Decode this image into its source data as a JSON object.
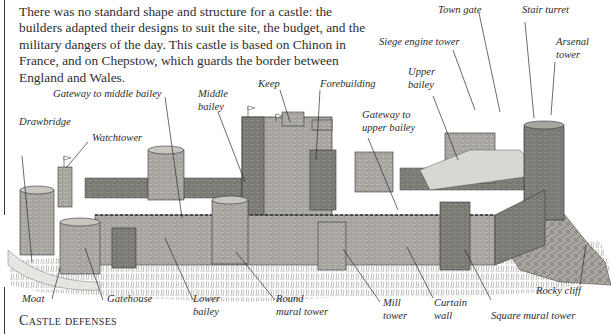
{
  "intro_text": "There was no standard shape and structure for a castle: the builders adapted their designs to suit the site, the budget, and the military dangers of the day. This castle is based on Chinon in France, and on Chepstow, which guards the border between England and Wales.",
  "caption": "Castle defenses",
  "labels": {
    "town_gate": "Town gate",
    "stair_turret": "Stair turret",
    "siege_engine_tower": "Siege engine tower",
    "arsenal_tower_1": "Arsenal",
    "arsenal_tower_2": "tower",
    "upper_bailey_1": "Upper",
    "upper_bailey_2": "bailey",
    "keep": "Keep",
    "forebuilding": "Forebuilding",
    "gateway_middle_bailey": "Gateway to middle bailey",
    "middle_bailey_1": "Middle",
    "middle_bailey_2": "bailey",
    "gateway_upper_bailey_1": "Gateway to",
    "gateway_upper_bailey_2": "upper bailey",
    "drawbridge": "Drawbridge",
    "watchtower": "Watchtower",
    "moat": "Moat",
    "gatehouse": "Gatehouse",
    "lower_bailey_1": "Lower",
    "lower_bailey_2": "bailey",
    "round_mural_tower_1": "Round",
    "round_mural_tower_2": "mural tower",
    "mill_tower_1": "Mill",
    "mill_tower_2": "tower",
    "curtain_wall_1": "Curtain",
    "curtain_wall_2": "wall",
    "square_mural_tower": "Square mural tower",
    "rocky_cliff": "Rocky cliff"
  },
  "colors": {
    "stone_light": "#c9c6c2",
    "stone_mid": "#9a9792",
    "stone_dark": "#5e5b57",
    "ink": "#2c2c2c",
    "grass": "#8a8780"
  }
}
